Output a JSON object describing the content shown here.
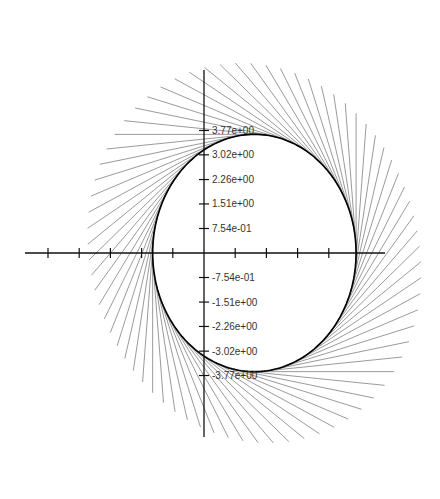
{
  "chart_data": {
    "type": "line",
    "title": "",
    "xlabel": "",
    "ylabel": "",
    "grid": false,
    "legend": null,
    "y_ticks": [
      {
        "value": 3.77,
        "label": "3.77e+00"
      },
      {
        "value": 3.02,
        "label": "3.02e+00"
      },
      {
        "value": 2.26,
        "label": "2.26e+00"
      },
      {
        "value": 1.51,
        "label": "1.51e+00"
      },
      {
        "value": 0.754,
        "label": "7.54e-01"
      },
      {
        "value": -0.754,
        "label": "-7.54e-01"
      },
      {
        "value": -1.51,
        "label": "-1.51e+00"
      },
      {
        "value": -2.26,
        "label": "-2.26e+00"
      },
      {
        "value": -3.02,
        "label": "-3.02e+00"
      },
      {
        "value": -3.77,
        "label": "-3.77e+00"
      }
    ],
    "x_ticks_unlabeled": [
      -5,
      -4,
      -3,
      -2,
      -1,
      1,
      2,
      3,
      4
    ],
    "ylim": [
      -4.4,
      4.4
    ],
    "xlim": [
      -5.8,
      5.8
    ],
    "envelope": {
      "center": [
        1.55,
        0.0
      ],
      "rx": 3.13,
      "ry": 3.65,
      "tangent_count": 72,
      "segment_length": 4.3
    }
  },
  "layout": {
    "origin_px": [
      204,
      253
    ],
    "px_per_unit_x": 32.5,
    "px_per_unit_y": 32.5,
    "y_axis_px": [
      70,
      437
    ],
    "x_axis_px": [
      25,
      385
    ],
    "colors": {
      "axis": "#111111",
      "tangent": "#555555",
      "envelope": "#000000",
      "label": "#333333"
    }
  }
}
